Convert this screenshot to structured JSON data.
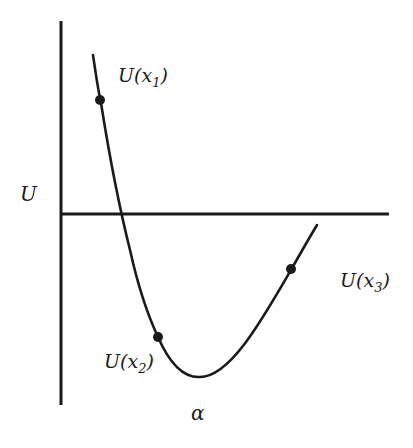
{
  "diagram": {
    "axis_label_y": "U",
    "axis_label_x": "α",
    "points": [
      {
        "id": "x1",
        "label": "U(x",
        "sub": "1",
        "close": ")"
      },
      {
        "id": "x2",
        "label": "U(x",
        "sub": "2",
        "close": ")"
      },
      {
        "id": "x3",
        "label": "U(x",
        "sub": "3",
        "close": ")"
      }
    ],
    "colors": {
      "stroke": "#1a1a1a",
      "background": "#ffffff"
    }
  }
}
